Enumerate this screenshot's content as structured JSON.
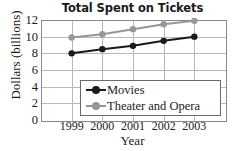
{
  "chart_data": {
    "type": "line",
    "title": "Total Spent on Tickets",
    "xlabel": "Year",
    "ylabel": "Dollars (billions)",
    "categories": [
      "1999",
      "2000",
      "2001",
      "2002",
      "2003"
    ],
    "yticks": [
      "12",
      "10",
      "8",
      "6",
      "4",
      "2",
      "0"
    ],
    "ytick_values": [
      12,
      10,
      8,
      6,
      4,
      2,
      0
    ],
    "ylim": [
      0,
      12
    ],
    "grid": true,
    "legend_position": "inside-bottom-right",
    "series": [
      {
        "name": "Movies",
        "color": "#1a1a1a",
        "values": [
          8.0,
          8.5,
          8.9,
          9.5,
          10.0
        ]
      },
      {
        "name": "Theater and Opera",
        "color": "#979797",
        "values": [
          9.9,
          10.3,
          10.9,
          11.5,
          11.9
        ]
      }
    ]
  }
}
